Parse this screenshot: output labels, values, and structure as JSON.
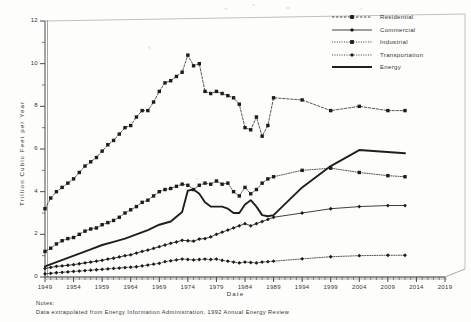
{
  "chart_data": {
    "type": "line",
    "title": "",
    "xlabel": "Date",
    "ylabel": "Trillion  Cubic  Feet  per  Year",
    "xlim": [
      1949,
      2019
    ],
    "ylim": [
      0,
      12
    ],
    "xticks": [
      1949,
      1954,
      1959,
      1964,
      1969,
      1974,
      1979,
      1984,
      1989,
      1994,
      1999,
      2004,
      2009,
      2014,
      2019
    ],
    "yticks": [
      0,
      2,
      4,
      6,
      8,
      10,
      12
    ],
    "yminor_step": 1,
    "grid": false,
    "legend_position": "top-right",
    "notes_head": "Notes:",
    "notes_body": "Data extrapolated from Energy Information Administration, 1992 Annual Energy Review",
    "series": [
      {
        "name": "Residential",
        "marker": "square",
        "line": "dashed",
        "x": [
          1949,
          1950,
          1951,
          1952,
          1953,
          1954,
          1955,
          1956,
          1957,
          1958,
          1959,
          1960,
          1961,
          1962,
          1963,
          1964,
          1965,
          1966,
          1967,
          1968,
          1969,
          1970,
          1971,
          1972,
          1973,
          1974,
          1975,
          1976,
          1977,
          1978,
          1979,
          1980,
          1981,
          1982,
          1983,
          1984,
          1985,
          1986,
          1987,
          1988,
          1989,
          1994,
          1999,
          2004,
          2009,
          2012
        ],
        "y": [
          3.2,
          3.7,
          4.0,
          4.2,
          4.4,
          4.6,
          4.9,
          5.2,
          5.4,
          5.6,
          5.9,
          6.2,
          6.4,
          6.7,
          7.0,
          7.1,
          7.5,
          7.8,
          7.8,
          8.2,
          8.7,
          9.1,
          9.2,
          9.4,
          9.6,
          10.4,
          9.9,
          10.0,
          8.7,
          8.6,
          8.7,
          8.6,
          8.5,
          8.4,
          8.1,
          7.0,
          6.9,
          7.5,
          6.6,
          7.1,
          8.4,
          8.3,
          7.8,
          8.0,
          7.8,
          7.8
        ]
      },
      {
        "name": "Commercial",
        "marker": "diamond",
        "line": "solid-thin",
        "x": [
          1949,
          1950,
          1951,
          1952,
          1953,
          1954,
          1955,
          1956,
          1957,
          1958,
          1959,
          1960,
          1961,
          1962,
          1963,
          1964,
          1965,
          1966,
          1967,
          1968,
          1969,
          1970,
          1971,
          1972,
          1973,
          1974,
          1975,
          1976,
          1977,
          1978,
          1979,
          1980,
          1981,
          1982,
          1983,
          1984,
          1985,
          1986,
          1987,
          1988,
          1989,
          1994,
          1999,
          2004,
          2009,
          2012
        ],
        "y": [
          0.4,
          0.45,
          0.5,
          0.52,
          0.55,
          0.58,
          0.62,
          0.66,
          0.7,
          0.74,
          0.78,
          0.84,
          0.88,
          0.94,
          1.0,
          1.04,
          1.12,
          1.2,
          1.26,
          1.34,
          1.42,
          1.5,
          1.58,
          1.64,
          1.72,
          1.7,
          1.68,
          1.78,
          1.8,
          1.88,
          2.0,
          2.1,
          2.2,
          2.3,
          2.4,
          2.5,
          2.4,
          2.5,
          2.6,
          2.7,
          2.8,
          3.0,
          3.2,
          3.3,
          3.35,
          3.35
        ]
      },
      {
        "name": "Industrial",
        "marker": "square",
        "line": "dotted",
        "x": [
          1949,
          1950,
          1951,
          1952,
          1953,
          1954,
          1955,
          1956,
          1957,
          1958,
          1959,
          1960,
          1961,
          1962,
          1963,
          1964,
          1965,
          1966,
          1967,
          1968,
          1969,
          1970,
          1971,
          1972,
          1973,
          1974,
          1975,
          1976,
          1977,
          1978,
          1979,
          1980,
          1981,
          1982,
          1983,
          1984,
          1985,
          1986,
          1987,
          1988,
          1989,
          1994,
          1999,
          2004,
          2009,
          2012
        ],
        "y": [
          1.2,
          1.35,
          1.55,
          1.7,
          1.8,
          1.85,
          2.0,
          2.15,
          2.25,
          2.3,
          2.45,
          2.55,
          2.65,
          2.8,
          3.0,
          3.15,
          3.3,
          3.5,
          3.6,
          3.8,
          4.0,
          4.1,
          4.15,
          4.25,
          4.35,
          4.3,
          4.1,
          4.3,
          4.4,
          4.35,
          4.5,
          4.35,
          4.4,
          4.0,
          3.8,
          4.2,
          3.9,
          4.1,
          4.4,
          4.6,
          4.7,
          5.0,
          5.1,
          4.9,
          4.75,
          4.7
        ]
      },
      {
        "name": "Transportation",
        "marker": "diamond",
        "line": "dotted",
        "x": [
          1949,
          1950,
          1951,
          1952,
          1953,
          1954,
          1955,
          1956,
          1957,
          1958,
          1959,
          1960,
          1961,
          1962,
          1963,
          1964,
          1965,
          1966,
          1967,
          1968,
          1969,
          1970,
          1971,
          1972,
          1973,
          1974,
          1975,
          1976,
          1977,
          1978,
          1979,
          1980,
          1981,
          1982,
          1983,
          1984,
          1985,
          1986,
          1987,
          1988,
          1989,
          1994,
          1999,
          2004,
          2009,
          2012
        ],
        "y": [
          0.15,
          0.17,
          0.2,
          0.22,
          0.24,
          0.26,
          0.28,
          0.3,
          0.32,
          0.34,
          0.36,
          0.38,
          0.4,
          0.42,
          0.44,
          0.46,
          0.48,
          0.52,
          0.56,
          0.6,
          0.64,
          0.72,
          0.76,
          0.8,
          0.84,
          0.82,
          0.8,
          0.82,
          0.84,
          0.82,
          0.84,
          0.78,
          0.74,
          0.7,
          0.66,
          0.7,
          0.68,
          0.66,
          0.7,
          0.72,
          0.74,
          0.85,
          0.95,
          1.0,
          1.02,
          1.02
        ]
      },
      {
        "name": "Energy",
        "marker": "none",
        "line": "solid-thick",
        "x": [
          1949,
          1951,
          1953,
          1955,
          1957,
          1959,
          1961,
          1963,
          1965,
          1967,
          1969,
          1971,
          1973,
          1974,
          1975,
          1976,
          1977,
          1978,
          1979,
          1980,
          1981,
          1982,
          1983,
          1984,
          1985,
          1986,
          1987,
          1988,
          1989,
          1994,
          1999,
          2004,
          2012
        ],
        "y": [
          0.5,
          0.7,
          0.9,
          1.1,
          1.3,
          1.5,
          1.65,
          1.8,
          2.0,
          2.2,
          2.45,
          2.6,
          3.05,
          4.05,
          4.1,
          3.9,
          3.5,
          3.3,
          3.3,
          3.3,
          3.2,
          3.0,
          3.0,
          3.4,
          3.6,
          3.3,
          2.9,
          2.85,
          2.9,
          4.2,
          5.2,
          5.95,
          5.8
        ]
      }
    ]
  },
  "legend": {
    "items": [
      {
        "label": "Residential"
      },
      {
        "label": "Commercial"
      },
      {
        "label": "Industrial"
      },
      {
        "label": "Transportation"
      },
      {
        "label": "Energy"
      }
    ]
  }
}
